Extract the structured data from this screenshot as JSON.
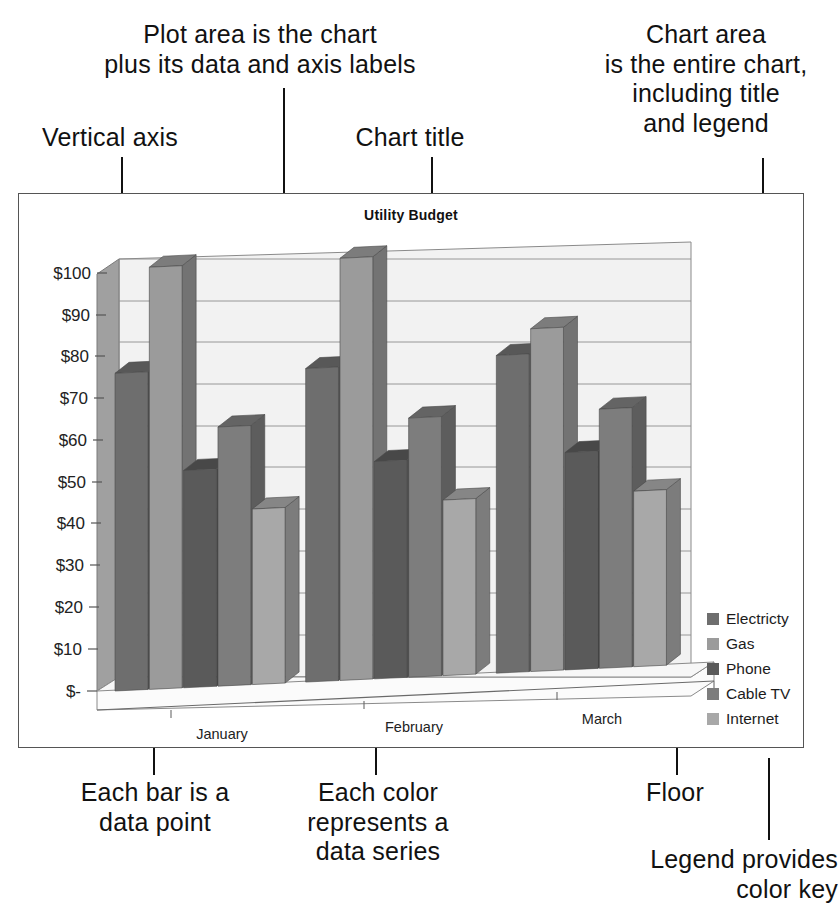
{
  "annotations": {
    "vertical_axis": "Vertical axis",
    "plot_area": "Plot area is the chart\nplus its data and axis labels",
    "chart_title_note": "Chart title",
    "chart_area": "Chart area\nis the entire chart,\nincluding title\nand legend",
    "each_bar": "Each bar is a\ndata point",
    "each_color": "Each color\nrepresents a\ndata series",
    "floor": "Floor",
    "legend_note": "Legend provides\ncolor key"
  },
  "chart_data": {
    "type": "bar",
    "title": "Utility Budget",
    "xlabel": "",
    "ylabel": "",
    "categories": [
      "January",
      "February",
      "March"
    ],
    "series": [
      {
        "name": "Electricty",
        "values": [
          76,
          75,
          76
        ],
        "color": "#6e6e6e"
      },
      {
        "name": "Gas",
        "values": [
          101,
          101,
          82
        ],
        "color": "#9b9b9b"
      },
      {
        "name": "Phone",
        "values": [
          52,
          52,
          52
        ],
        "color": "#5a5a5a"
      },
      {
        "name": "Cable TV",
        "values": [
          62,
          62,
          62
        ],
        "color": "#7d7d7d"
      },
      {
        "name": "Internet",
        "values": [
          42,
          42,
          42
        ],
        "color": "#a8a8a8"
      }
    ],
    "ylim": [
      0,
      105
    ],
    "ytick_values": [
      0,
      10,
      20,
      30,
      40,
      50,
      60,
      70,
      80,
      90,
      100
    ],
    "ytick_labels": [
      "$-",
      "$10",
      "$20",
      "$30",
      "$40",
      "$50",
      "$60",
      "$70",
      "$80",
      "$90",
      "$100"
    ],
    "grid": true,
    "legend_position": "right",
    "three_d": true
  }
}
